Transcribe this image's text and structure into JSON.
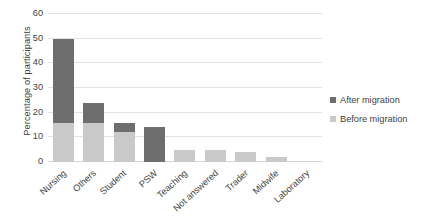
{
  "chart_data": {
    "type": "bar",
    "title": "",
    "xlabel": "",
    "ylabel": "Percentage of participants",
    "ylim": [
      0,
      60
    ],
    "yticks": [
      0,
      10,
      20,
      30,
      40,
      50,
      60
    ],
    "ytick_labels": [
      "0",
      "10",
      "20",
      "30",
      "40",
      "50",
      "60"
    ],
    "grid": "horizontal",
    "stacked": true,
    "legend_position": "right",
    "categories": [
      "Nursing",
      "Others",
      "Student",
      "PSW",
      "Teaching",
      "Not answered",
      "Trader",
      "Midwife",
      "Laboratory"
    ],
    "series": [
      {
        "name": "Before migration",
        "color": "#c9c9c9",
        "values": [
          16,
          16,
          12,
          0,
          5,
          5,
          4,
          2,
          0
        ]
      },
      {
        "name": "After migration",
        "color": "#6e6e6e",
        "values": [
          34,
          8,
          4,
          14,
          0,
          0,
          0,
          0,
          0
        ]
      }
    ],
    "totals": [
      50,
      24,
      16,
      14,
      5,
      5,
      4,
      2,
      0
    ]
  },
  "legend": {
    "items": [
      {
        "label": "After migration",
        "color": "#6e6e6e",
        "swatch": "after"
      },
      {
        "label": "Before migration",
        "color": "#c9c9c9",
        "swatch": "before"
      }
    ]
  },
  "colors": {
    "after_migration": "#6e6e6e",
    "before_migration": "#c9c9c9",
    "gridline": "#e2e2e2",
    "text": "#3f3f3f",
    "background": "#ffffff"
  }
}
